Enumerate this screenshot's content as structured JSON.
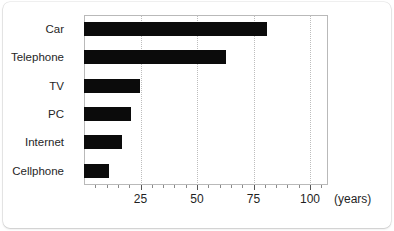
{
  "chart_data": {
    "type": "bar",
    "orientation": "horizontal",
    "title": "",
    "xlabel": "(years)",
    "ylabel": "",
    "categories": [
      "Car",
      "Telephone",
      "TV",
      "PC",
      "Internet",
      "Cellphone"
    ],
    "values": [
      81,
      63,
      25,
      21,
      17,
      11
    ],
    "xlim": [
      0,
      108
    ],
    "xticks": [
      25,
      50,
      75,
      100
    ],
    "xtick_labels": [
      "25",
      "50",
      "75",
      "100"
    ],
    "minor_tick_step": 5,
    "grid": true,
    "grid_axis": "x",
    "grid_style": "dotted",
    "legend": null,
    "bar_color": "#0b0b0b",
    "grid_color": "#bdbdbd",
    "frame_color": "#b9b9b9",
    "background": "#ffffff",
    "unit": "(years)"
  }
}
